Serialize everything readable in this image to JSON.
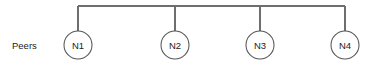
{
  "diagram": {
    "row_label": "Peers",
    "bus": {
      "name": "shared-bus-line",
      "y": 6,
      "x_start": 78,
      "x_end": 345,
      "color": "#6e6e6e"
    },
    "node_geometry": {
      "radius": 14,
      "center_y": 45,
      "stroke_color": "#555555",
      "fill_color": "#ffffff"
    },
    "nodes": [
      {
        "id": "n1",
        "label": "N1",
        "cx": 78
      },
      {
        "id": "n2",
        "label": "N2",
        "cx": 175
      },
      {
        "id": "n3",
        "label": "N3",
        "cx": 260
      },
      {
        "id": "n4",
        "label": "N4",
        "cx": 345
      }
    ],
    "row_label_position": {
      "x": 12,
      "y": 45
    },
    "background_color": "#ffffff"
  }
}
